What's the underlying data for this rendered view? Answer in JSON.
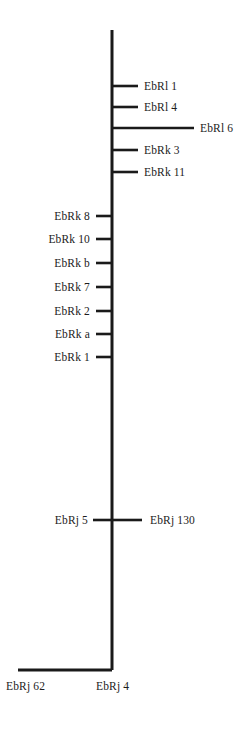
{
  "diagram": {
    "type": "seriation-bar-tree",
    "background_color": "#ffffff",
    "line_color": "#1a1a1a",
    "text_color": "#1c1c1c",
    "trunk": {
      "name": "main-vertical-stem",
      "x": 112,
      "y_top": 30,
      "y_bottom": 670
    },
    "basal_branch": {
      "name": "basal-horizontal-branch",
      "y": 670,
      "x_start": 112,
      "x_end": 18
    },
    "nodes": [
      {
        "id": "ebrl-1",
        "label": "EbRl 1",
        "side": "right",
        "y": 86,
        "branch_x_end": 138,
        "label_x": 144
      },
      {
        "id": "ebrl-4",
        "label": "EbRl 4",
        "side": "right",
        "y": 107,
        "branch_x_end": 138,
        "label_x": 144
      },
      {
        "id": "ebrl-6",
        "label": "EbRl 6",
        "side": "right",
        "y": 128,
        "branch_x_end": 194,
        "label_x": 200
      },
      {
        "id": "ebrk-3",
        "label": "EbRk 3",
        "side": "right",
        "y": 150,
        "branch_x_end": 138,
        "label_x": 144
      },
      {
        "id": "ebrk-11",
        "label": "EbRk 11",
        "side": "right",
        "y": 172,
        "branch_x_end": 138,
        "label_x": 144
      },
      {
        "id": "ebrk-8",
        "label": "EbRk 8",
        "side": "left",
        "y": 216,
        "branch_x_end": 96,
        "label_x": 90
      },
      {
        "id": "ebrk-10",
        "label": "EbRk 10",
        "side": "left",
        "y": 239,
        "branch_x_end": 96,
        "label_x": 90
      },
      {
        "id": "ebrk-b",
        "label": "EbRk b",
        "side": "left",
        "y": 263,
        "branch_x_end": 96,
        "label_x": 90
      },
      {
        "id": "ebrk-7",
        "label": "EbRk 7",
        "side": "left",
        "y": 287,
        "branch_x_end": 96,
        "label_x": 90
      },
      {
        "id": "ebrk-2",
        "label": "EbRk 2",
        "side": "left",
        "y": 311,
        "branch_x_end": 96,
        "label_x": 90
      },
      {
        "id": "ebrk-a",
        "label": "EbRk a",
        "side": "left",
        "y": 334,
        "branch_x_end": 96,
        "label_x": 90
      },
      {
        "id": "ebrk-1",
        "label": "EbRk 1",
        "side": "left",
        "y": 357,
        "branch_x_end": 96,
        "label_x": 90
      },
      {
        "id": "ebrj-5",
        "label": "EbRj 5",
        "side": "left",
        "y": 520,
        "branch_x_end": 93,
        "label_x": 88
      },
      {
        "id": "ebrj-130",
        "label": "EbRj 130",
        "side": "right",
        "y": 520,
        "branch_x_end": 142,
        "label_x": 150
      }
    ],
    "basal_labels": [
      {
        "id": "ebrj-62",
        "label": "EbRj 62",
        "x": 6,
        "y": 680
      },
      {
        "id": "ebrj-4",
        "label": "EbRj 4",
        "x": 96,
        "y": 680
      }
    ]
  }
}
